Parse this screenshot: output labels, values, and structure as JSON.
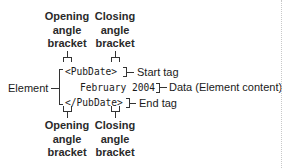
{
  "diagram": {
    "top_labels": {
      "opening": [
        "Opening",
        "angle",
        "bracket"
      ],
      "closing": [
        "Closing",
        "angle",
        "bracket"
      ]
    },
    "bottom_labels": {
      "opening": [
        "Opening",
        "angle",
        "bracket"
      ],
      "closing": [
        "Closing",
        "angle",
        "bracket"
      ]
    },
    "code": {
      "start_tag": "<PubDate>",
      "data": "February 2004",
      "end_tag": "</PubDate>"
    },
    "annotations": {
      "element": "Element",
      "start_tag": "Start tag",
      "data": "Data (Element content)",
      "end_tag": "End tag"
    },
    "colors": {
      "text": "#1a1a1a",
      "line": "#333333",
      "divider": "#c8c8c8"
    }
  }
}
